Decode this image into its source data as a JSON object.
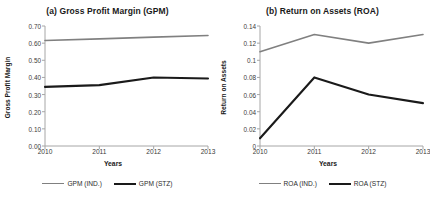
{
  "figure": {
    "width": 430,
    "height": 201,
    "background": "#ffffff"
  },
  "colors": {
    "industry_line": "#808080",
    "company_line": "#1a1a1a",
    "axis": "#a6a6a6",
    "text": "#2b2b2b"
  },
  "panels": [
    {
      "id": "gpm",
      "title": "(a) Gross Profit Margin (GPM)",
      "ylabel": "Gross Profit Margin",
      "xlabel": "Years",
      "yticks": [
        "0.70",
        "0.60",
        "0.50",
        "0.40",
        "0.30",
        "0.20",
        "0.10",
        "0.00"
      ],
      "xticks": [
        "2010",
        "2011",
        "2012",
        "2013"
      ],
      "legend": [
        {
          "label": "GPM (IND.)",
          "color": "#808080",
          "width": 1.6
        },
        {
          "label": "GPM (STZ)",
          "color": "#1a1a1a",
          "width": 2.2
        }
      ]
    },
    {
      "id": "roa",
      "title": "(b) Return on Assets (ROA)",
      "ylabel": "Return on Assets",
      "xlabel": "Years",
      "yticks": [
        "0.14",
        "0.12",
        "0.1",
        "0.08",
        "0.06",
        "0.04",
        "0.02",
        "0"
      ],
      "xticks": [
        "2010",
        "2011",
        "2012",
        "2013"
      ],
      "legend": [
        {
          "label": "ROA (IND.)",
          "color": "#808080",
          "width": 1.6
        },
        {
          "label": "ROA (STZ)",
          "color": "#1a1a1a",
          "width": 2.2
        }
      ]
    }
  ],
  "chart_data": [
    {
      "type": "line",
      "title": "(a) Gross Profit Margin (GPM)",
      "xlabel": "Years",
      "ylabel": "Gross Profit Margin",
      "x": [
        2010,
        2011,
        2012,
        2013
      ],
      "xlim": [
        2010,
        2013
      ],
      "ylim": [
        0.0,
        0.7
      ],
      "ytick_values": [
        0.0,
        0.1,
        0.2,
        0.3,
        0.4,
        0.5,
        0.6,
        0.7
      ],
      "grid": false,
      "legend_position": "bottom",
      "series": [
        {
          "name": "GPM (IND.)",
          "color": "#808080",
          "values": [
            0.615,
            0.625,
            0.635,
            0.645
          ]
        },
        {
          "name": "GPM (STZ)",
          "color": "#1a1a1a",
          "values": [
            0.345,
            0.355,
            0.4,
            0.394
          ]
        }
      ]
    },
    {
      "type": "line",
      "title": "(b) Return on Assets (ROA)",
      "xlabel": "Years",
      "ylabel": "Return on Assets",
      "x": [
        2010,
        2011,
        2012,
        2013
      ],
      "xlim": [
        2010,
        2013
      ],
      "ylim": [
        0.0,
        0.14
      ],
      "ytick_values": [
        0.0,
        0.02,
        0.04,
        0.06,
        0.08,
        0.1,
        0.12,
        0.14
      ],
      "grid": false,
      "legend_position": "bottom",
      "series": [
        {
          "name": "ROA (IND.)",
          "color": "#808080",
          "values": [
            0.11,
            0.13,
            0.12,
            0.13
          ]
        },
        {
          "name": "ROA (STZ)",
          "color": "#1a1a1a",
          "values": [
            0.009,
            0.08,
            0.06,
            0.05
          ]
        }
      ]
    }
  ]
}
